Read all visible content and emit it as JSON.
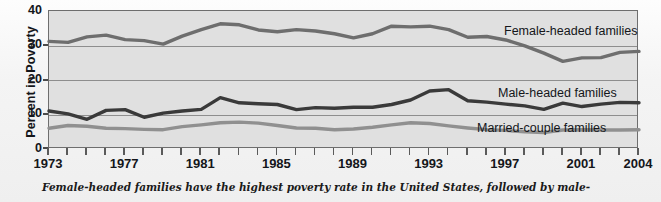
{
  "chart_data": {
    "type": "line",
    "title": "",
    "xlabel": "",
    "ylabel": "Percent in Poverty",
    "ylim": [
      0,
      40
    ],
    "xlim": [
      1973,
      2004
    ],
    "yticks": [
      0,
      10,
      20,
      30,
      40
    ],
    "grid": true,
    "legend_position": "in-plot-right",
    "x": [
      1973,
      1974,
      1975,
      1976,
      1977,
      1978,
      1979,
      1980,
      1981,
      1982,
      1983,
      1984,
      1985,
      1986,
      1987,
      1988,
      1989,
      1990,
      1991,
      1992,
      1993,
      1994,
      1995,
      1996,
      1997,
      1998,
      1999,
      2000,
      2001,
      2002,
      2003,
      2004
    ],
    "xticklabels": [
      "1973",
      "",
      "",
      "",
      "1977",
      "",
      "",
      "",
      "1981",
      "",
      "",
      "",
      "1985",
      "",
      "",
      "",
      "1989",
      "",
      "",
      "",
      "1993",
      "",
      "",
      "",
      "1997",
      "",
      "",
      "",
      "2001",
      "",
      "",
      "2004"
    ],
    "series": [
      {
        "name": "Female-headed families",
        "color": "#6e6e6e",
        "values": [
          31.2,
          30.9,
          32.5,
          33.0,
          31.7,
          31.4,
          30.4,
          32.7,
          34.6,
          36.3,
          36.0,
          34.5,
          34.0,
          34.6,
          34.2,
          33.4,
          32.2,
          33.4,
          35.6,
          35.4,
          35.6,
          34.6,
          32.4,
          32.6,
          31.6,
          29.9,
          27.8,
          25.4,
          26.4,
          26.5,
          28.0,
          28.3
        ]
      },
      {
        "name": "Male-headed families",
        "color": "#3a3a3a",
        "values": [
          11.0,
          10.2,
          8.6,
          11.2,
          11.4,
          9.2,
          10.4,
          11.0,
          11.5,
          14.9,
          13.4,
          13.1,
          12.9,
          11.4,
          12.0,
          11.8,
          12.1,
          12.1,
          12.9,
          14.2,
          16.8,
          17.2,
          14.0,
          13.6,
          13.0,
          12.5,
          11.5,
          13.3,
          12.3,
          13.0,
          13.5,
          13.4
        ]
      },
      {
        "name": "Married-couple families",
        "color": "#909090",
        "values": [
          6.0,
          6.8,
          6.6,
          6.0,
          5.9,
          5.7,
          5.6,
          6.5,
          7.0,
          7.6,
          7.8,
          7.5,
          6.8,
          6.1,
          6.0,
          5.6,
          5.8,
          6.3,
          7.0,
          7.6,
          7.4,
          6.7,
          6.1,
          5.6,
          5.4,
          5.0,
          4.8,
          5.5,
          5.6,
          5.5,
          5.5,
          5.6
        ]
      }
    ]
  },
  "axis": {
    "y_title": "Percent in Poverty",
    "y_ticks": [
      "40",
      "30",
      "20",
      "10",
      "0"
    ],
    "x_ticks": [
      "1973",
      "1977",
      "1981",
      "1985",
      "1989",
      "1993",
      "1997",
      "2001",
      "2004"
    ]
  },
  "series_labels": {
    "female": "Female-headed families",
    "male": "Male-headed families",
    "married": "Married-couple families"
  },
  "caption": {
    "line1": "Female-headed families have the highest poverty rate in the United States, followed by male-"
  },
  "colors": {
    "female_line": "#6e6e6e",
    "male_line": "#3a3a3a",
    "married_line": "#909090",
    "plot_background": "#e0e0e0",
    "frame": "#6e6e6e",
    "gridline": "#8e8e8e",
    "text": "#14161a"
  }
}
